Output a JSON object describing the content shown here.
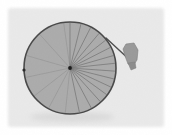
{
  "image": {
    "title": "Spoked bicycle wheel with handle",
    "width": 172,
    "height": 135,
    "background_color": "#ffffff",
    "panel_color": "#e9e9e9",
    "panel_edge_color": "#f4f4f4"
  },
  "panel": {
    "label": "photo-backdrop",
    "x": 8,
    "y": 8,
    "width": 156,
    "height": 119,
    "fill": "#e9e9e9"
  },
  "wheel": {
    "label": "bicycle wheel",
    "center_x": 70,
    "center_y": 68,
    "radius": 46,
    "rim_color": "#4a4a4a",
    "rim_width": 1.6,
    "disc_fill": "#a9a9a9",
    "disc_opacity": 0.95,
    "spoke_color": "#6d6d6d",
    "spoke_width": 0.7,
    "spoke_count": 22,
    "spoke_angles_deg": [
      -90,
      -76,
      -63,
      -50,
      -38,
      -27,
      -16,
      -6,
      4,
      14,
      25,
      36,
      48,
      62,
      78,
      96,
      118,
      142,
      168,
      196,
      228,
      262
    ]
  },
  "hub": {
    "label": "wheel hub",
    "x": 70,
    "y": 68,
    "radius": 1.9,
    "fill": "#1d1d1d"
  },
  "valve": {
    "label": "rim valve mark",
    "x": 24,
    "y": 70,
    "radius": 1.6,
    "fill": "#2b2b2b"
  },
  "handle_rod": {
    "label": "handle rod",
    "x1": 106,
    "y1": 38,
    "x2": 132,
    "y2": 62,
    "color": "#4e4e4e",
    "width": 1.4
  },
  "grip": {
    "label": "handle grip",
    "fill": "#9a9a9a",
    "stroke": "#7d7d7d",
    "points": "126,44 134,43 138,50 137,60 133,66 128,64 125,56 123,49"
  },
  "grip_tip": {
    "label": "handle grip tip",
    "fill": "#8d8d8d",
    "points": "128,63 135,62 136,68 131,70"
  },
  "shadow": {
    "label": "soft shadow under wheel",
    "cx": 72,
    "cy": 117,
    "rx": 42,
    "ry": 5,
    "fill": "#cfcfcf",
    "opacity": 0.55
  }
}
